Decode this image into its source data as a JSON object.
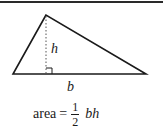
{
  "figure": {
    "shape": "triangle",
    "vertices": {
      "apex": [
        46,
        15
      ],
      "bottom_left": [
        13,
        74
      ],
      "bottom_right": [
        146,
        74
      ]
    },
    "height_line": {
      "from": [
        46,
        15
      ],
      "to": [
        46,
        74
      ],
      "style": "dotted"
    },
    "right_angle_marker": {
      "x": 46,
      "y": 68,
      "size": 6
    },
    "labels": {
      "height": "h",
      "base": "b"
    },
    "colors": {
      "stroke": "#1a1a1a",
      "height_line": "#555555",
      "background": "#ffffff",
      "rule": "#2a2a2a"
    }
  },
  "formula": {
    "lhs": "area",
    "equals": "=",
    "fraction": {
      "numerator": "1",
      "denominator": "2"
    },
    "rhs_vars": "bh"
  }
}
